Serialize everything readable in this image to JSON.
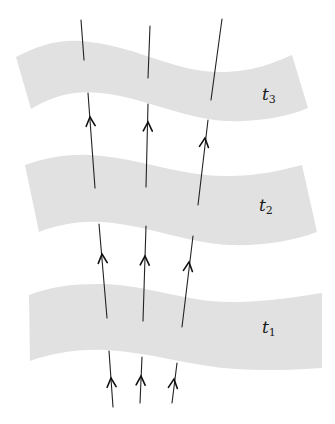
{
  "diagram": {
    "type": "spacetime-slices",
    "colors": {
      "background": "#ffffff",
      "slice_fill": "#e1e1e1",
      "line": "#222222"
    },
    "slices": [
      {
        "id": "t3",
        "label_base": "t",
        "label_sub": "3",
        "path": "M16,57 C40,45 60,38 90,42 C140,48 175,72 220,72 C255,72 275,62 292,55 L308,108 C285,118 255,122 225,121 C180,118 140,96 100,93 C70,90 50,98 31,109 Z",
        "label_pos": {
          "x": 262,
          "y": 86
        }
      },
      {
        "id": "t2",
        "label_base": "t",
        "label_sub": "2",
        "path": "M25,165 C45,158 65,154 90,155 C140,158 180,176 225,176 C260,176 282,170 302,165 L317,232 C290,242 260,246 230,245 C185,243 145,224 100,222 C75,221 55,226 39,232 Z",
        "label_pos": {
          "x": 259,
          "y": 197
        }
      },
      {
        "id": "t1",
        "label_base": "t",
        "label_sub": "1",
        "path": "M29,295 C50,287 70,284 100,284 C150,285 185,302 230,302 C270,302 300,296 322,293 L322,368 C295,370 265,371 235,369 C190,366 150,352 105,350 C75,349 50,354 30,361 Z",
        "label_pos": {
          "x": 262,
          "y": 319
        }
      }
    ],
    "worldlines": [
      {
        "id": "w1",
        "segments": [
          {
            "from": [
              113,
              407
            ],
            "to": [
              109,
              351
            ],
            "arrow_at": [
              111,
              378
            ]
          },
          {
            "from": [
              107,
              318
            ],
            "to": [
              99,
              224
            ],
            "arrow_at": [
              102,
              254
            ]
          },
          {
            "from": [
              95,
              188
            ],
            "to": [
              88,
              93
            ],
            "arrow_at": [
              90,
              117
            ]
          },
          {
            "from": [
              84,
              60
            ],
            "to": [
              81,
              20
            ],
            "arrow_at": null
          }
        ]
      },
      {
        "id": "w2",
        "segments": [
          {
            "from": [
              140,
              403
            ],
            "to": [
              142,
              357
            ],
            "arrow_at": [
              141,
              376
            ]
          },
          {
            "from": [
              143,
              321
            ],
            "to": [
              146,
              226
            ],
            "arrow_at": [
              145,
              256
            ]
          },
          {
            "from": [
              146,
              187
            ],
            "to": [
              148,
              104
            ],
            "arrow_at": [
              148,
              122
            ]
          },
          {
            "from": [
              148,
              78
            ],
            "to": [
              150,
              26
            ],
            "arrow_at": null
          }
        ]
      },
      {
        "id": "w3",
        "segments": [
          {
            "from": [
              172,
              403
            ],
            "to": [
              177,
              363
            ],
            "arrow_at": [
              174,
              379
            ]
          },
          {
            "from": [
              182,
              327
            ],
            "to": [
              193,
              236
            ],
            "arrow_at": [
              189,
              262
            ]
          },
          {
            "from": [
              198,
              205
            ],
            "to": [
              208,
              120
            ],
            "arrow_at": [
              205,
              138
            ]
          },
          {
            "from": [
              211,
              100
            ],
            "to": [
              222,
              19
            ],
            "arrow_at": null
          }
        ]
      }
    ]
  }
}
